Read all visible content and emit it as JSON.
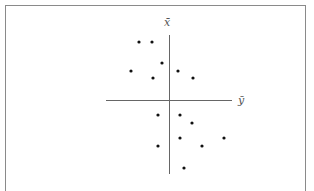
{
  "diagram": {
    "type": "scatter-quadrant",
    "axes": {
      "vertical_label": "x̄",
      "horizontal_label": "ȳ",
      "origin": [
        169,
        100
      ],
      "vertical_span": [
        35,
        174
      ],
      "horizontal_span": [
        106,
        232
      ]
    },
    "points": [
      [
        139,
        42
      ],
      [
        152,
        42
      ],
      [
        162,
        63
      ],
      [
        131,
        71
      ],
      [
        153,
        78
      ],
      [
        178,
        71
      ],
      [
        193,
        78
      ],
      [
        158,
        115
      ],
      [
        180,
        115
      ],
      [
        192,
        123
      ],
      [
        180,
        138
      ],
      [
        224,
        138
      ],
      [
        158,
        146
      ],
      [
        202,
        146
      ],
      [
        184,
        168
      ]
    ],
    "colors": {
      "axis": "#666666",
      "point": "#111111",
      "border": "#8a8a8a"
    }
  }
}
